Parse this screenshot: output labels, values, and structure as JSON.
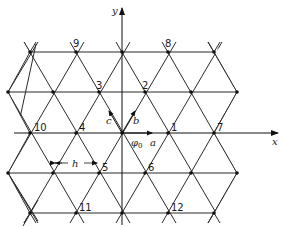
{
  "diagram": {
    "axes": {
      "x_label": "x",
      "y_label": "y"
    },
    "origin_label": "φ0",
    "origin_label_main": "φ",
    "origin_label_sub": "0",
    "vectors": [
      {
        "name": "a",
        "label": "a"
      },
      {
        "name": "b",
        "label": "b"
      },
      {
        "name": "c",
        "label": "c"
      }
    ],
    "spacing_label": "h",
    "node_labels": [
      "1",
      "2",
      "3",
      "4",
      "5",
      "6",
      "7",
      "8",
      "9",
      "10",
      "11",
      "12"
    ],
    "colors": {
      "line": "#2a2a2a",
      "node": "#111111",
      "background": "#ffffff"
    }
  }
}
